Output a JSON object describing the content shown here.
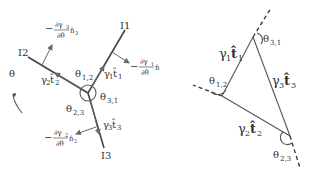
{
  "left_diagram": {
    "boundaries": [
      {
        "id": "I1",
        "label": "I1"
      },
      {
        "id": "I2",
        "label": "I2"
      },
      {
        "id": "I3",
        "label": "I3"
      }
    ],
    "theta_label": "θ",
    "angles": {
      "a12": {
        "main": "θ",
        "sub": "1,2"
      },
      "a23": {
        "main": "θ",
        "sub": "2,3"
      },
      "a31": {
        "main": "θ",
        "sub": "3,1"
      }
    },
    "tension_vectors": {
      "t1": {
        "gamma": "γ",
        "gsub": "1",
        "t": "t̂",
        "tsub": "1"
      },
      "t2": {
        "gamma": "γ",
        "gsub": "2",
        "t": "t̂",
        "tsub": "2"
      },
      "t3": {
        "gamma": "γ",
        "gsub": "3",
        "t": "t̂",
        "tsub": "3"
      }
    },
    "normal_terms": {
      "n1": {
        "prefix": "−",
        "num": "∂γ",
        "numsub": "1",
        "den": "∂θ",
        "n": "n̂",
        "nsub": "1"
      },
      "n2": {
        "prefix": "−",
        "num": "∂γ",
        "numsub": "2",
        "den": "∂θ",
        "n": "n̂",
        "nsub": "2"
      },
      "n3": {
        "prefix": "−",
        "num": "∂γ",
        "numsub": "3",
        "den": "∂θ",
        "n": "n̂",
        "nsub": "3"
      }
    }
  },
  "right_diagram": {
    "angles": {
      "a12": {
        "main": "θ",
        "sub": "1,2"
      },
      "a23": {
        "main": "θ",
        "sub": "2,3"
      },
      "a31": {
        "main": "θ",
        "sub": "3,1"
      }
    },
    "sides": {
      "s1": {
        "gamma": "γ",
        "gsub": "1",
        "t": "t̂",
        "tsub": "1"
      },
      "s2": {
        "gamma": "γ",
        "gsub": "2",
        "t": "t̂",
        "tsub": "2"
      },
      "s3": {
        "gamma": "γ",
        "gsub": "3",
        "t": "t̂",
        "tsub": "3"
      }
    }
  }
}
